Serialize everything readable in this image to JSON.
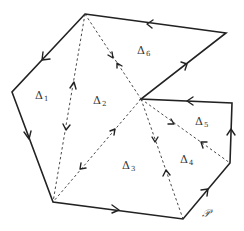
{
  "diagram": {
    "polygon_label": "𝒫",
    "vertices": {
      "A": [
        85,
        14
      ],
      "B": [
        226,
        33
      ],
      "C": [
        141,
        99
      ],
      "D": [
        232,
        103
      ],
      "E": [
        230,
        163
      ],
      "F": [
        183,
        219
      ],
      "G": [
        53,
        202
      ],
      "H": [
        12,
        92
      ]
    },
    "boundary_edges": [
      {
        "from": "B",
        "to": "A"
      },
      {
        "from": "A",
        "to": "H"
      },
      {
        "from": "H",
        "to": "G"
      },
      {
        "from": "G",
        "to": "F"
      },
      {
        "from": "F",
        "to": "E"
      },
      {
        "from": "E",
        "to": "D"
      },
      {
        "from": "D",
        "to": "C"
      },
      {
        "from": "C",
        "to": "B"
      }
    ],
    "diagonals": [
      {
        "from": "A",
        "to": "G"
      },
      {
        "from": "A",
        "to": "C"
      },
      {
        "from": "C",
        "to": "G"
      },
      {
        "from": "C",
        "to": "F"
      },
      {
        "from": "C",
        "to": "E"
      }
    ],
    "triangles": [
      {
        "name": "Δ",
        "index": "1"
      },
      {
        "name": "Δ",
        "index": "2"
      },
      {
        "name": "Δ",
        "index": "3"
      },
      {
        "name": "Δ",
        "index": "4"
      },
      {
        "name": "Δ",
        "index": "5"
      },
      {
        "name": "Δ",
        "index": "6"
      }
    ]
  }
}
